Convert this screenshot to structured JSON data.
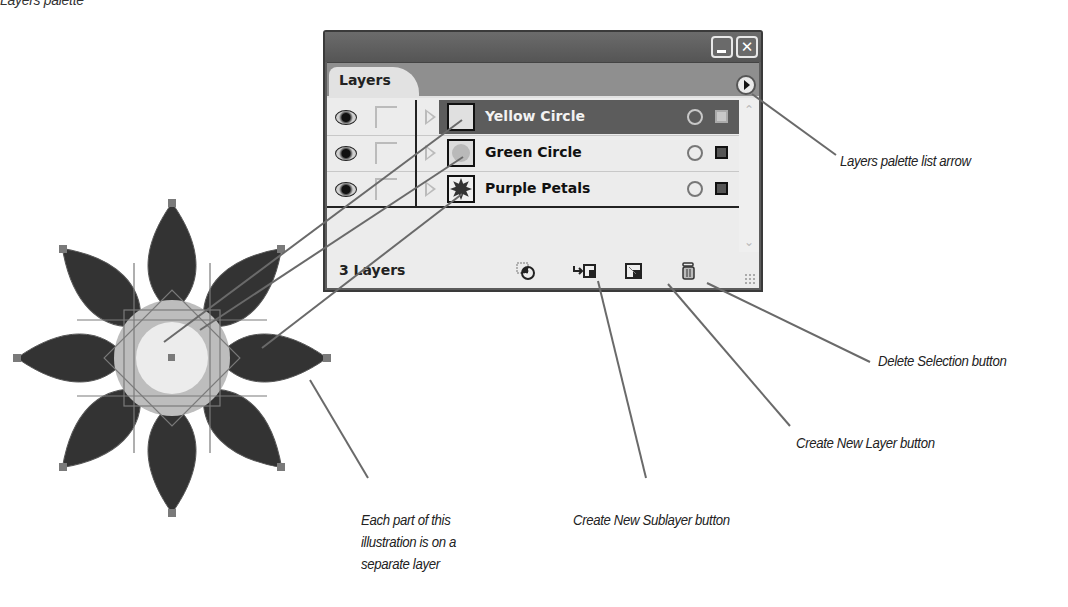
{
  "figure": {
    "caption": "Layers palette"
  },
  "palette": {
    "window_buttons": {
      "minimize": "_",
      "close": "✕"
    },
    "tab_label": "Layers",
    "list_arrow_icon": "palette-menu-arrow",
    "layers": [
      {
        "name": "Yellow Circle",
        "visible": true,
        "selected": true,
        "thumb": "yellow-circle"
      },
      {
        "name": "Green Circle",
        "visible": true,
        "selected": false,
        "thumb": "green-circle"
      },
      {
        "name": "Purple Petals",
        "visible": true,
        "selected": false,
        "thumb": "purple-petals"
      }
    ],
    "footer": {
      "count_label": "3 Layers",
      "buttons": [
        {
          "id": "make-clipping-mask",
          "icon": "clipping-mask-icon"
        },
        {
          "id": "create-new-sublayer",
          "icon": "new-sublayer-icon"
        },
        {
          "id": "create-new-layer",
          "icon": "new-layer-icon"
        },
        {
          "id": "delete-selection",
          "icon": "trash-icon"
        }
      ]
    }
  },
  "callouts": {
    "list_arrow": "Layers palette list arrow",
    "delete": "Delete Selection button",
    "new_layer": "Create New Layer button",
    "new_sublayer": "Create New Sublayer button",
    "illustration_line1": "Each part of this",
    "illustration_line2": "illustration is on a",
    "illustration_line3": "separate layer"
  },
  "colors": {
    "petals": "#333333",
    "green_circle": "#bdbdbd",
    "yellow_circle": "#ececec",
    "callout_line": "#6a6a6a",
    "selected_row": "#5c5c5c"
  }
}
